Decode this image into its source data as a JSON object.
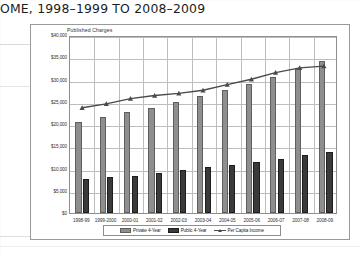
{
  "document": {
    "heading": "OME, 1998–1999 TO 2008–2009"
  },
  "chart": {
    "subtitle": "Published Charges",
    "legend": {
      "private_label": "Private 4-Year",
      "public_label": "Public 4-Year",
      "income_label": "Per Capita Income"
    },
    "colors": {
      "private_bar": "#8e8e8e",
      "public_bar": "#3a3a3a",
      "income_line": "#4a4a4a",
      "gridline": "#bdbdbd",
      "frame": "#8e8e8e",
      "background": "#ffffff"
    }
  },
  "chart_data": {
    "type": "bar",
    "title": "Published Charges",
    "xlabel": "",
    "ylabel": "",
    "ylim": [
      0,
      40000
    ],
    "yticks": [
      0,
      5000,
      10000,
      15000,
      20000,
      25000,
      30000,
      35000,
      40000
    ],
    "ytick_labels": [
      "$0",
      "$5,000",
      "$10,000",
      "$15,000",
      "$20,000",
      "$25,000",
      "$30,000",
      "$35,000",
      "$40,000"
    ],
    "grid": true,
    "legend_position": "bottom",
    "categories": [
      "1998-99",
      "1999-2000",
      "2000-01",
      "2001-02",
      "2002-03",
      "2003-04",
      "2004-05",
      "2005-06",
      "2006-07",
      "2007-08",
      "2008-09"
    ],
    "series": [
      {
        "name": "Private 4-Year",
        "type": "bar",
        "values": [
          20500,
          21600,
          22600,
          23700,
          25000,
          26300,
          27600,
          29000,
          30600,
          32300,
          34100
        ]
      },
      {
        "name": "Public 4-Year",
        "type": "bar",
        "values": [
          7700,
          8100,
          8400,
          8900,
          9600,
          10300,
          10900,
          11500,
          12200,
          13000,
          13800
        ]
      },
      {
        "name": "Per Capita Income",
        "type": "line",
        "marker": "triangle",
        "values": [
          23900,
          24800,
          26000,
          26700,
          27200,
          27900,
          29200,
          30400,
          31900,
          33000,
          33400
        ]
      }
    ]
  }
}
